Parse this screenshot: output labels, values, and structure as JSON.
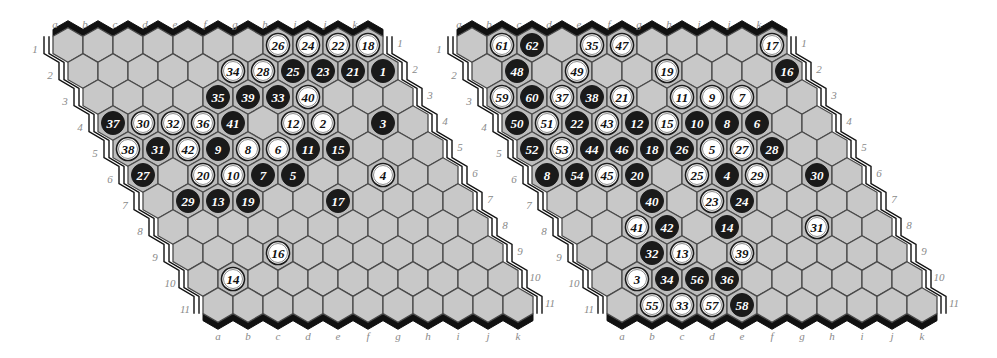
{
  "colors": {
    "cell": "#c8c8c8",
    "cell_stroke": "#4a4a4a",
    "black_stone": "#1a1a1a",
    "white_stone": "#ffffff",
    "label": "#8a8a8a",
    "background": "#ffffff"
  },
  "column_labels": [
    "a",
    "b",
    "c",
    "d",
    "e",
    "f",
    "g",
    "h",
    "i",
    "j",
    "k"
  ],
  "row_labels": [
    "1",
    "2",
    "3",
    "4",
    "5",
    "6",
    "7",
    "8",
    "9",
    "10",
    "11"
  ],
  "boards": [
    {
      "name": "left-board",
      "size": 11,
      "origin": {
        "x": 68,
        "y": 45
      },
      "stones": [
        {
          "cell": "h1",
          "color": "white",
          "n": "26"
        },
        {
          "cell": "i1",
          "color": "white",
          "n": "24"
        },
        {
          "cell": "j1",
          "color": "white",
          "n": "22"
        },
        {
          "cell": "k1",
          "color": "white",
          "n": "18"
        },
        {
          "cell": "f2",
          "color": "white",
          "n": "34"
        },
        {
          "cell": "g2",
          "color": "white",
          "n": "28"
        },
        {
          "cell": "h2",
          "color": "black",
          "n": "25"
        },
        {
          "cell": "i2",
          "color": "black",
          "n": "23"
        },
        {
          "cell": "j2",
          "color": "black",
          "n": "21"
        },
        {
          "cell": "k2",
          "color": "black",
          "n": "1"
        },
        {
          "cell": "e3",
          "color": "black",
          "n": "35"
        },
        {
          "cell": "f3",
          "color": "black",
          "n": "39"
        },
        {
          "cell": "g3",
          "color": "black",
          "n": "33"
        },
        {
          "cell": "h3",
          "color": "white",
          "n": "40"
        },
        {
          "cell": "a4",
          "color": "black",
          "n": "37"
        },
        {
          "cell": "b4",
          "color": "white",
          "n": "30"
        },
        {
          "cell": "c4",
          "color": "white",
          "n": "32"
        },
        {
          "cell": "d4",
          "color": "white",
          "n": "36"
        },
        {
          "cell": "e4",
          "color": "black",
          "n": "41"
        },
        {
          "cell": "g4",
          "color": "white",
          "n": "12"
        },
        {
          "cell": "h4",
          "color": "white",
          "n": "2"
        },
        {
          "cell": "j4",
          "color": "black",
          "n": "3"
        },
        {
          "cell": "a5",
          "color": "white",
          "n": "38"
        },
        {
          "cell": "b5",
          "color": "black",
          "n": "31"
        },
        {
          "cell": "c5",
          "color": "white",
          "n": "42"
        },
        {
          "cell": "d5",
          "color": "black",
          "n": "9"
        },
        {
          "cell": "e5",
          "color": "white",
          "n": "8"
        },
        {
          "cell": "f5",
          "color": "white",
          "n": "6"
        },
        {
          "cell": "g5",
          "color": "black",
          "n": "11"
        },
        {
          "cell": "h5",
          "color": "black",
          "n": "15"
        },
        {
          "cell": "a6",
          "color": "black",
          "n": "27"
        },
        {
          "cell": "c6",
          "color": "white",
          "n": "20"
        },
        {
          "cell": "d6",
          "color": "white",
          "n": "10"
        },
        {
          "cell": "e6",
          "color": "black",
          "n": "7"
        },
        {
          "cell": "f6",
          "color": "black",
          "n": "5"
        },
        {
          "cell": "i6",
          "color": "white",
          "n": "4"
        },
        {
          "cell": "b7",
          "color": "black",
          "n": "29"
        },
        {
          "cell": "c7",
          "color": "black",
          "n": "13"
        },
        {
          "cell": "d7",
          "color": "black",
          "n": "19"
        },
        {
          "cell": "g7",
          "color": "black",
          "n": "17"
        },
        {
          "cell": "d9",
          "color": "white",
          "n": "16"
        },
        {
          "cell": "b10",
          "color": "white",
          "n": "14"
        }
      ]
    },
    {
      "name": "right-board",
      "size": 11,
      "origin": {
        "x": 472,
        "y": 45
      },
      "stones": [
        {
          "cell": "b1",
          "color": "white",
          "n": "61"
        },
        {
          "cell": "c1",
          "color": "black",
          "n": "62"
        },
        {
          "cell": "e1",
          "color": "white",
          "n": "35"
        },
        {
          "cell": "f1",
          "color": "white",
          "n": "47"
        },
        {
          "cell": "k1",
          "color": "white",
          "n": "17"
        },
        {
          "cell": "b2",
          "color": "black",
          "n": "48"
        },
        {
          "cell": "d2",
          "color": "white",
          "n": "49"
        },
        {
          "cell": "g2",
          "color": "white",
          "n": "19"
        },
        {
          "cell": "k2",
          "color": "black",
          "n": "16"
        },
        {
          "cell": "a3",
          "color": "white",
          "n": "59"
        },
        {
          "cell": "b3",
          "color": "black",
          "n": "60"
        },
        {
          "cell": "c3",
          "color": "white",
          "n": "37"
        },
        {
          "cell": "d3",
          "color": "black",
          "n": "38"
        },
        {
          "cell": "e3",
          "color": "white",
          "n": "21"
        },
        {
          "cell": "g3",
          "color": "white",
          "n": "11"
        },
        {
          "cell": "h3",
          "color": "white",
          "n": "9"
        },
        {
          "cell": "i3",
          "color": "white",
          "n": "7"
        },
        {
          "cell": "a4",
          "color": "black",
          "n": "50"
        },
        {
          "cell": "b4",
          "color": "white",
          "n": "51"
        },
        {
          "cell": "c4",
          "color": "black",
          "n": "22"
        },
        {
          "cell": "d4",
          "color": "white",
          "n": "43"
        },
        {
          "cell": "e4",
          "color": "black",
          "n": "12"
        },
        {
          "cell": "f4",
          "color": "white",
          "n": "15"
        },
        {
          "cell": "g4",
          "color": "black",
          "n": "10"
        },
        {
          "cell": "h4",
          "color": "black",
          "n": "8"
        },
        {
          "cell": "i4",
          "color": "black",
          "n": "6"
        },
        {
          "cell": "a5",
          "color": "black",
          "n": "52"
        },
        {
          "cell": "b5",
          "color": "white",
          "n": "53"
        },
        {
          "cell": "c5",
          "color": "black",
          "n": "44"
        },
        {
          "cell": "d5",
          "color": "black",
          "n": "46"
        },
        {
          "cell": "e5",
          "color": "black",
          "n": "18"
        },
        {
          "cell": "f5",
          "color": "black",
          "n": "26"
        },
        {
          "cell": "g5",
          "color": "white",
          "n": "5"
        },
        {
          "cell": "h5",
          "color": "white",
          "n": "27"
        },
        {
          "cell": "i5",
          "color": "black",
          "n": "28"
        },
        {
          "cell": "a6",
          "color": "black",
          "n": "8"
        },
        {
          "cell": "b6",
          "color": "black",
          "n": "54"
        },
        {
          "cell": "c6",
          "color": "white",
          "n": "45"
        },
        {
          "cell": "d6",
          "color": "black",
          "n": "20"
        },
        {
          "cell": "f6",
          "color": "white",
          "n": "25"
        },
        {
          "cell": "g6",
          "color": "black",
          "n": "4"
        },
        {
          "cell": "h6",
          "color": "white",
          "n": "29"
        },
        {
          "cell": "j6",
          "color": "black",
          "n": "30"
        },
        {
          "cell": "d7",
          "color": "black",
          "n": "40"
        },
        {
          "cell": "f7",
          "color": "white",
          "n": "23"
        },
        {
          "cell": "g7",
          "color": "black",
          "n": "24"
        },
        {
          "cell": "c8",
          "color": "white",
          "n": "41"
        },
        {
          "cell": "d8",
          "color": "black",
          "n": "42"
        },
        {
          "cell": "f8",
          "color": "black",
          "n": "14"
        },
        {
          "cell": "i8",
          "color": "white",
          "n": "31"
        },
        {
          "cell": "c9",
          "color": "black",
          "n": "32"
        },
        {
          "cell": "d9",
          "color": "white",
          "n": "13"
        },
        {
          "cell": "f9",
          "color": "white",
          "n": "39"
        },
        {
          "cell": "b10",
          "color": "white",
          "n": "3"
        },
        {
          "cell": "c10",
          "color": "black",
          "n": "34"
        },
        {
          "cell": "d10",
          "color": "black",
          "n": "56"
        },
        {
          "cell": "e10",
          "color": "black",
          "n": "36"
        },
        {
          "cell": "b11",
          "color": "white",
          "n": "55"
        },
        {
          "cell": "c11",
          "color": "white",
          "n": "33"
        },
        {
          "cell": "d11",
          "color": "white",
          "n": "57"
        },
        {
          "cell": "e11",
          "color": "black",
          "n": "58"
        }
      ]
    }
  ]
}
